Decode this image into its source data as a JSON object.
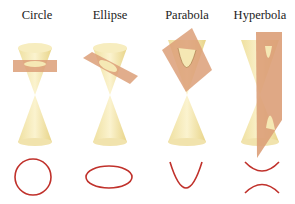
{
  "figure": {
    "panels": [
      {
        "label": "Circle",
        "curve": "circle"
      },
      {
        "label": "Ellipse",
        "curve": "ellipse"
      },
      {
        "label": "Parabola",
        "curve": "parabola"
      },
      {
        "label": "Hyperbola",
        "curve": "hyperbola"
      }
    ],
    "colors": {
      "cone": "#f3e6a6",
      "cone_shade": "#e6d27f",
      "plane": "#dc9f78",
      "curve": "#c0312b",
      "text": "#222222"
    }
  }
}
